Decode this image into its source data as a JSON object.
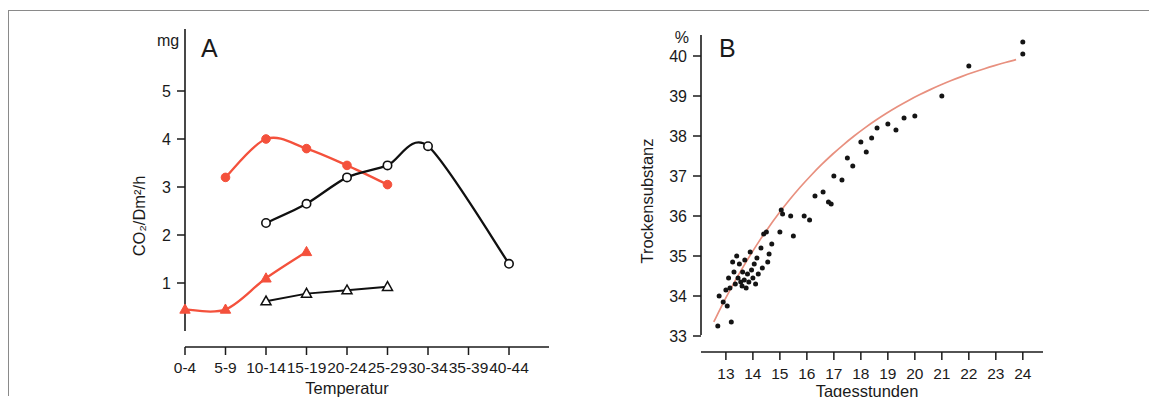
{
  "figure": {
    "background": "#ffffff",
    "frame_color": "#8a8a8a",
    "accent_red": "#f4513c",
    "fit_line_color": "#e8907f",
    "black": "#101010"
  },
  "chart_data": [
    {
      "type": "line",
      "panel_label": "A",
      "title": "",
      "xlabel": "Temperatur",
      "ylabel": "CO₂/Dm²/h",
      "y_unit": "mg",
      "categories": [
        "0-4",
        "5-9",
        "10-14",
        "15-19",
        "20-24",
        "25-29",
        "30-34",
        "35-39",
        "40-44"
      ],
      "yticks": [
        1,
        2,
        3,
        4,
        5
      ],
      "ylim": [
        0,
        5.9
      ],
      "grid": false,
      "legend_position": "none",
      "series": [
        {
          "name": "red-upper-circles",
          "marker": "filled-circle",
          "color": "#f4513c",
          "x": [
            "5-9",
            "10-14",
            "15-19",
            "20-24",
            "25-29"
          ],
          "values": [
            3.2,
            4.0,
            3.8,
            3.45,
            3.05
          ]
        },
        {
          "name": "black-upper-circles",
          "marker": "open-circle",
          "color": "#101010",
          "x": [
            "10-14",
            "15-19",
            "20-24",
            "25-29",
            "30-34",
            "40-44"
          ],
          "values": [
            2.25,
            2.65,
            3.2,
            3.45,
            3.85,
            1.4
          ]
        },
        {
          "name": "red-lower-triangles",
          "marker": "filled-triangle",
          "color": "#f4513c",
          "x": [
            "0-4",
            "5-9",
            "10-14",
            "15-19"
          ],
          "values": [
            0.45,
            0.45,
            1.1,
            1.65
          ]
        },
        {
          "name": "black-lower-triangles",
          "marker": "open-triangle",
          "color": "#101010",
          "x": [
            "10-14",
            "15-19",
            "20-24",
            "25-29"
          ],
          "values": [
            0.62,
            0.78,
            0.85,
            0.92
          ]
        }
      ]
    },
    {
      "type": "scatter",
      "panel_label": "B",
      "title": "",
      "xlabel": "Tagesstunden",
      "ylabel": "Trockensubstanz",
      "y_unit": "%",
      "xticks": [
        13,
        14,
        15,
        16,
        17,
        18,
        19,
        20,
        21,
        22,
        23,
        24
      ],
      "yticks": [
        33,
        34,
        35,
        36,
        37,
        38,
        39,
        40
      ],
      "xlim": [
        12.3,
        24.6
      ],
      "ylim": [
        32.7,
        40.5
      ],
      "grid": false,
      "legend_position": "none",
      "points": [
        [
          12.7,
          33.25
        ],
        [
          12.75,
          34.0
        ],
        [
          12.9,
          33.85
        ],
        [
          13.0,
          34.15
        ],
        [
          13.05,
          33.75
        ],
        [
          13.1,
          34.45
        ],
        [
          13.15,
          34.2
        ],
        [
          13.2,
          33.35
        ],
        [
          13.25,
          34.85
        ],
        [
          13.3,
          34.6
        ],
        [
          13.35,
          34.3
        ],
        [
          13.4,
          35.0
        ],
        [
          13.45,
          34.45
        ],
        [
          13.5,
          34.8
        ],
        [
          13.55,
          34.35
        ],
        [
          13.6,
          34.25
        ],
        [
          13.62,
          34.6
        ],
        [
          13.68,
          34.4
        ],
        [
          13.7,
          34.9
        ],
        [
          13.75,
          34.2
        ],
        [
          13.8,
          34.55
        ],
        [
          13.85,
          34.35
        ],
        [
          13.9,
          35.1
        ],
        [
          13.95,
          34.65
        ],
        [
          14.0,
          34.45
        ],
        [
          14.05,
          34.8
        ],
        [
          14.1,
          34.3
        ],
        [
          14.15,
          34.95
        ],
        [
          14.2,
          34.55
        ],
        [
          14.3,
          35.2
        ],
        [
          14.35,
          34.7
        ],
        [
          14.4,
          35.55
        ],
        [
          14.5,
          35.6
        ],
        [
          14.55,
          34.85
        ],
        [
          14.6,
          35.05
        ],
        [
          14.7,
          35.3
        ],
        [
          15.0,
          35.6
        ],
        [
          15.05,
          36.15
        ],
        [
          15.1,
          36.05
        ],
        [
          15.4,
          36.0
        ],
        [
          15.5,
          35.5
        ],
        [
          15.9,
          36.0
        ],
        [
          16.1,
          35.9
        ],
        [
          16.3,
          36.5
        ],
        [
          16.6,
          36.6
        ],
        [
          16.8,
          36.35
        ],
        [
          16.9,
          36.3
        ],
        [
          17.0,
          37.0
        ],
        [
          17.3,
          36.9
        ],
        [
          17.5,
          37.45
        ],
        [
          17.7,
          37.25
        ],
        [
          18.0,
          37.85
        ],
        [
          18.2,
          37.6
        ],
        [
          18.4,
          37.95
        ],
        [
          18.6,
          38.2
        ],
        [
          19.0,
          38.3
        ],
        [
          19.3,
          38.15
        ],
        [
          19.6,
          38.45
        ],
        [
          20.0,
          38.5
        ],
        [
          21.0,
          39.0
        ],
        [
          22.0,
          39.75
        ],
        [
          24.0,
          40.35
        ],
        [
          24.0,
          40.05
        ]
      ],
      "fit_curve_description": "smooth increasing curve from 33.3% at 12.6 h to 40.1% at 24 h"
    }
  ]
}
